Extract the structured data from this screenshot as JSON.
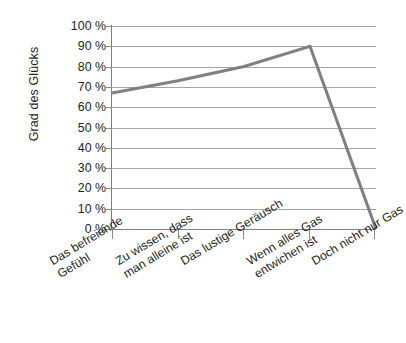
{
  "chart_data": {
    "type": "line",
    "title": "",
    "subtitle": "",
    "xlabel": "",
    "ylabel": "Grad des Glücks",
    "ylim": [
      0,
      100
    ],
    "ytick_values": [
      0,
      10,
      20,
      30,
      40,
      50,
      60,
      70,
      80,
      90,
      100
    ],
    "ytick_labels": [
      "0 %",
      "10 %",
      "20 %",
      "30 %",
      "40 %",
      "50 %",
      "60 %",
      "70 %",
      "80 %",
      "90 %",
      "100 %"
    ],
    "grid": true,
    "legend": "none",
    "categories": [
      "Das befreiende Gefühl",
      "Zu wissen, dass man alleine ist",
      "Das lustige Geräusch",
      "Wenn alles Gas entwichen ist",
      "Doch nicht nur Gas"
    ],
    "category_lines": [
      [
        "Das befreiende",
        "Gefühl"
      ],
      [
        "Zu wissen, dass",
        "man alleine ist"
      ],
      [
        "Das lustige Geräusch",
        ""
      ],
      [
        "Wenn alles Gas",
        "entwichen ist"
      ],
      [
        "Doch nicht nur Gas",
        ""
      ]
    ],
    "values": [
      67,
      73,
      80,
      90,
      0
    ],
    "series": [
      {
        "name": "Grad des Glücks",
        "values": [
          67,
          73,
          80,
          90,
          0
        ],
        "color": "#808080"
      }
    ]
  },
  "colors": {
    "series_line": "#808080",
    "gridline": "#a6a6a6",
    "axis": "#808080",
    "text": "#231f20",
    "background": "#ffffff"
  }
}
